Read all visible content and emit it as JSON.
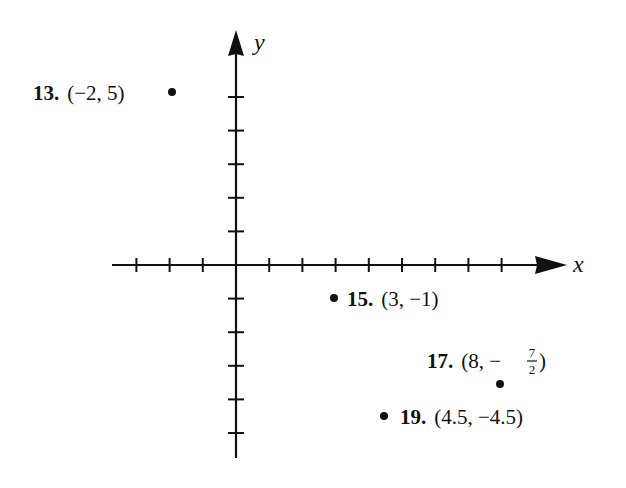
{
  "chart_data": {
    "type": "scatter",
    "title": "",
    "xlabel": "x",
    "ylabel": "y",
    "grid": false,
    "legend": null,
    "x_ticks": [
      -3,
      -2,
      -1,
      1,
      2,
      3,
      4,
      5,
      6,
      7,
      8
    ],
    "y_ticks": [
      -5,
      -4,
      -3,
      -2,
      -1,
      1,
      2,
      3,
      4,
      5
    ],
    "xlim": [
      -3.7,
      10
    ],
    "ylim": [
      -5.8,
      7
    ],
    "tick_labels_shown": false,
    "points": [
      {
        "id": "13",
        "label": "13.",
        "coord_text": "(−2, 5)",
        "x": -2,
        "y": 5
      },
      {
        "id": "15",
        "label": "15.",
        "coord_text": "(3, −1)",
        "x": 3,
        "y": -1
      },
      {
        "id": "17",
        "label": "17.",
        "coord_text": "(8, −7/2)",
        "x": 8,
        "y": -3.5
      },
      {
        "id": "19",
        "label": "19.",
        "coord_text": "(4.5, −4.5)",
        "x": 4.5,
        "y": -4.5
      }
    ]
  },
  "labels": {
    "p13": {
      "num": "13.",
      "coord": "(−2, 5)"
    },
    "p15": {
      "num": "15.",
      "coord": "(3, −1)"
    },
    "p17": {
      "num": "17.",
      "open": "(8, −",
      "frac_num": "7",
      "frac_den": "2",
      "close": ")"
    },
    "p19": {
      "num": "19.",
      "coord": "(4.5, −4.5)"
    },
    "x_axis": "x",
    "y_axis": "y"
  },
  "colors": {
    "ink": "#111111",
    "background": "#ffffff"
  }
}
